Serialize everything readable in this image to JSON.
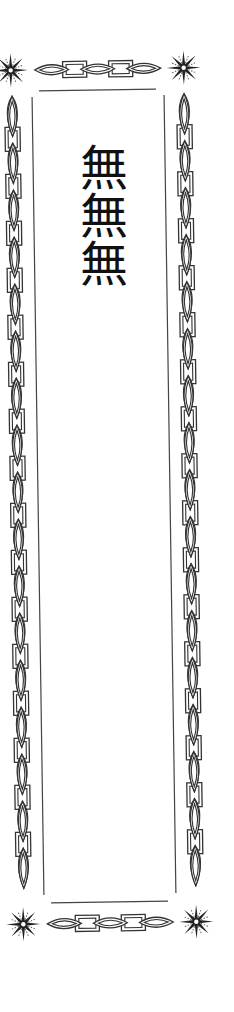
{
  "card": {
    "text": "無無無",
    "ink_color": "#222222",
    "paper_color": "#ffffff"
  },
  "ornaments": {
    "corner_icon": "starburst-icon",
    "border_pattern": "lens-and-rectangle-chain",
    "top_chain": [
      "lens",
      "rect",
      "lens",
      "rect",
      "lens"
    ],
    "bottom_chain": [
      "lens",
      "rect",
      "lens",
      "rect",
      "lens"
    ],
    "side_chain_lens_count": 17
  }
}
